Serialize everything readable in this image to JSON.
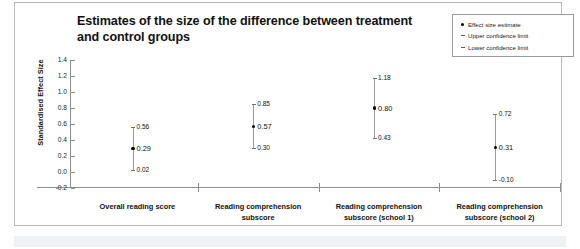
{
  "chart_data": {
    "type": "scatter",
    "title": "Estimates of the size of the difference between treatment and control groups",
    "xlabel": "",
    "ylabel": "Standardised Effect Size",
    "ylim": [
      -0.2,
      1.4
    ],
    "ytick_labels": [
      "1.4",
      "1.2",
      "1.0",
      "0.8",
      "0.6",
      "0.4",
      "0.2",
      "0.0",
      "-0.2"
    ],
    "ytick_values": [
      1.4,
      1.2,
      1.0,
      0.8,
      0.6,
      0.4,
      0.2,
      0.0,
      -0.2
    ],
    "grid": false,
    "legend_position": "top-right",
    "categories": [
      "Overall reading score",
      "Reading comprehension subscore",
      "Reading comprehension subscore (school 1)",
      "Reading comprehension subscore (school 2)"
    ],
    "series": [
      {
        "name": "Effect size estimate",
        "values": [
          0.29,
          0.57,
          0.8,
          0.31
        ]
      },
      {
        "name": "Upper confidence limit",
        "values": [
          0.56,
          0.85,
          1.18,
          0.72
        ]
      },
      {
        "name": "Lower confidence limit",
        "values": [
          0.02,
          0.3,
          0.43,
          -0.1
        ]
      }
    ],
    "points": [
      {
        "category": "Overall reading score",
        "estimate": "0.29",
        "upper": "0.56",
        "lower": "0.02",
        "estimate_value": 0.29,
        "upper_value": 0.56,
        "lower_value": 0.02
      },
      {
        "category": "Reading comprehension subscore",
        "estimate": "0.57",
        "upper": "0.85",
        "lower": "0.30",
        "estimate_value": 0.57,
        "upper_value": 0.85,
        "lower_value": 0.3
      },
      {
        "category": "Reading comprehension subscore (school 1)",
        "estimate": "0.80",
        "upper": "1.18",
        "lower": "0.43",
        "estimate_value": 0.8,
        "upper_value": 1.18,
        "lower_value": 0.43
      },
      {
        "category": "Reading comprehension subscore (school 2)",
        "estimate": "0.31",
        "upper": "0.72",
        "lower": "-0.10",
        "estimate_value": 0.31,
        "upper_value": 0.72,
        "lower_value": -0.1
      }
    ]
  },
  "legend": {
    "items": [
      {
        "label": "Effect size estimate",
        "marker": "dot-marker-icon"
      },
      {
        "label": "Upper confidence limit",
        "marker": "dash-marker-icon"
      },
      {
        "label": "Lower confidence limit",
        "marker": "dash-marker-icon"
      }
    ]
  },
  "axis": {
    "y_title": "Standardised Effect Size",
    "x_labels": [
      "Overall reading score",
      "Reading comprehension subscore",
      "Reading comprehension subscore (school 1)",
      "Reading comprehension subscore (school 2)"
    ]
  },
  "colors": {
    "marker": "#000000",
    "ci_line": "#9b9b9b",
    "axis": "#8e8e8e",
    "text": "#111111",
    "card_border": "#b9b9b9",
    "bottom_band": "#eef1f5"
  }
}
